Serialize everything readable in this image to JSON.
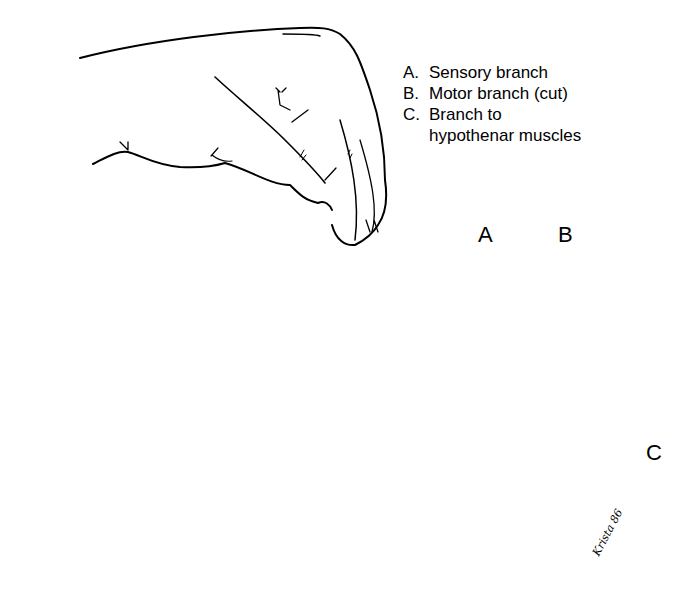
{
  "legend": {
    "items": [
      {
        "key": "A.",
        "text": "Sensory branch"
      },
      {
        "key": "B.",
        "text": "Motor branch (cut)"
      },
      {
        "key": "C.",
        "text": "Branch to",
        "continuation": "hypothenar muscles"
      }
    ]
  },
  "callouts": {
    "a": "A",
    "b": "B",
    "c": "C"
  },
  "signature": "Krista 86",
  "colors": {
    "ink": "#000000",
    "paper": "#ffffff"
  }
}
